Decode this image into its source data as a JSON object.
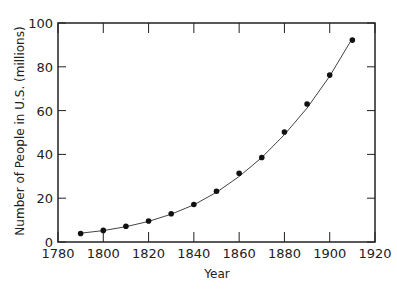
{
  "chart_data": {
    "type": "scatter",
    "title": "",
    "xlabel": "Year",
    "ylabel": "Number of People in U.S. (millions)",
    "xlim": [
      1780,
      1920
    ],
    "ylim": [
      0,
      100
    ],
    "xticks": [
      1780,
      1800,
      1820,
      1840,
      1860,
      1880,
      1900,
      1920
    ],
    "yticks": [
      0,
      20,
      40,
      60,
      80,
      100
    ],
    "grid": false,
    "legend": null,
    "series": [
      {
        "name": "Census population",
        "kind": "scatter",
        "marker": "filled-circle",
        "x": [
          1790,
          1800,
          1810,
          1820,
          1830,
          1840,
          1850,
          1860,
          1870,
          1880,
          1890,
          1900,
          1910
        ],
        "y": [
          3.9,
          5.3,
          7.2,
          9.6,
          12.9,
          17.1,
          23.2,
          31.4,
          38.6,
          50.2,
          63.0,
          76.2,
          92.2
        ]
      },
      {
        "name": "Fitted curve",
        "kind": "line",
        "x": [
          1790,
          1800,
          1810,
          1820,
          1830,
          1840,
          1850,
          1860,
          1870,
          1880,
          1890,
          1900,
          1910
        ],
        "y": [
          4.0,
          5.2,
          7.0,
          9.4,
          12.7,
          17.0,
          22.7,
          29.9,
          38.6,
          49.0,
          61.2,
          75.7,
          93.0
        ]
      }
    ]
  },
  "colors": {
    "axis": "#222222",
    "marker": "#111111",
    "line": "#444444"
  }
}
